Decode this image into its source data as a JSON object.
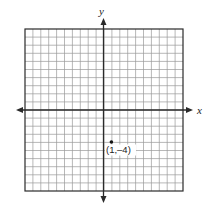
{
  "chart_data": {
    "type": "scatter",
    "title": "",
    "xlabel": "x",
    "ylabel": "y",
    "xlim": [
      -10,
      10
    ],
    "ylim": [
      -10,
      10
    ],
    "grid": true,
    "grid_cells": 20,
    "tick_labels": false,
    "points": [
      {
        "x": 1,
        "y": -4,
        "label": "(1,–4)"
      }
    ]
  },
  "axes": {
    "x_label": "x",
    "y_label": "y"
  },
  "point_label": "(1,–4)",
  "colors": {
    "grid": "#9a9a9a",
    "axis": "#2a2a2a",
    "border": "#2a2a2a",
    "point": "#111111"
  }
}
